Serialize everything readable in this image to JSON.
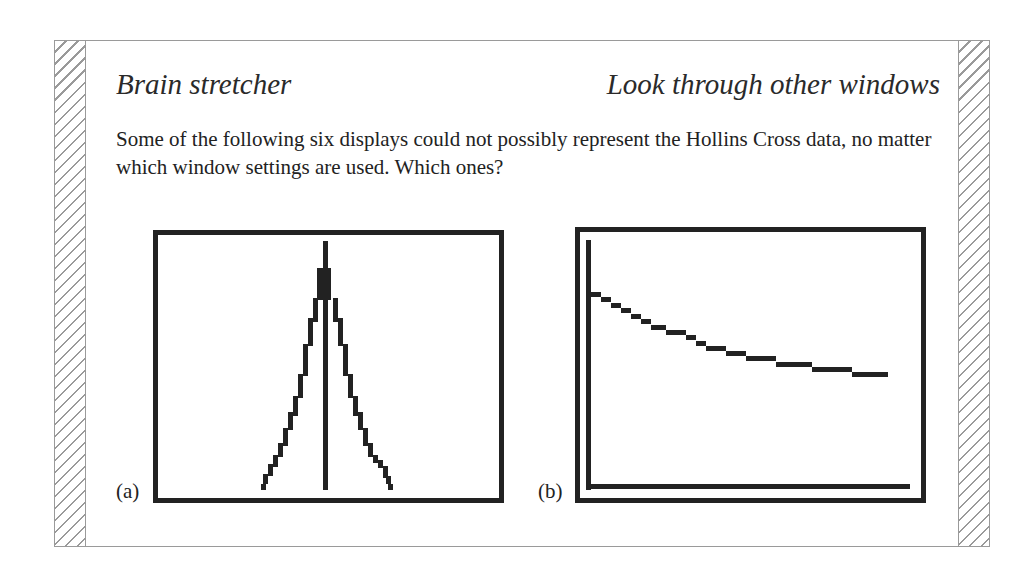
{
  "header": {
    "title_left": "Brain stretcher",
    "title_right": "Look through other windows"
  },
  "body": {
    "question": "Some of the following six displays could not possibly represent the Hollins Cross data, no matter which window settings are used. Which ones?"
  },
  "displays": [
    {
      "label": "(a)",
      "description": "Symmetric peaked pixel plot with central vertical axis line"
    },
    {
      "label": "(b)",
      "description": "Decreasing stepped pixel curve with L-shaped axes"
    }
  ],
  "icons": {
    "left_margin": "hatched-margin-strip",
    "right_margin": "hatched-margin-strip"
  },
  "colors": {
    "ink": "#222222",
    "border": "#9a9a9a",
    "background": "#ffffff"
  }
}
